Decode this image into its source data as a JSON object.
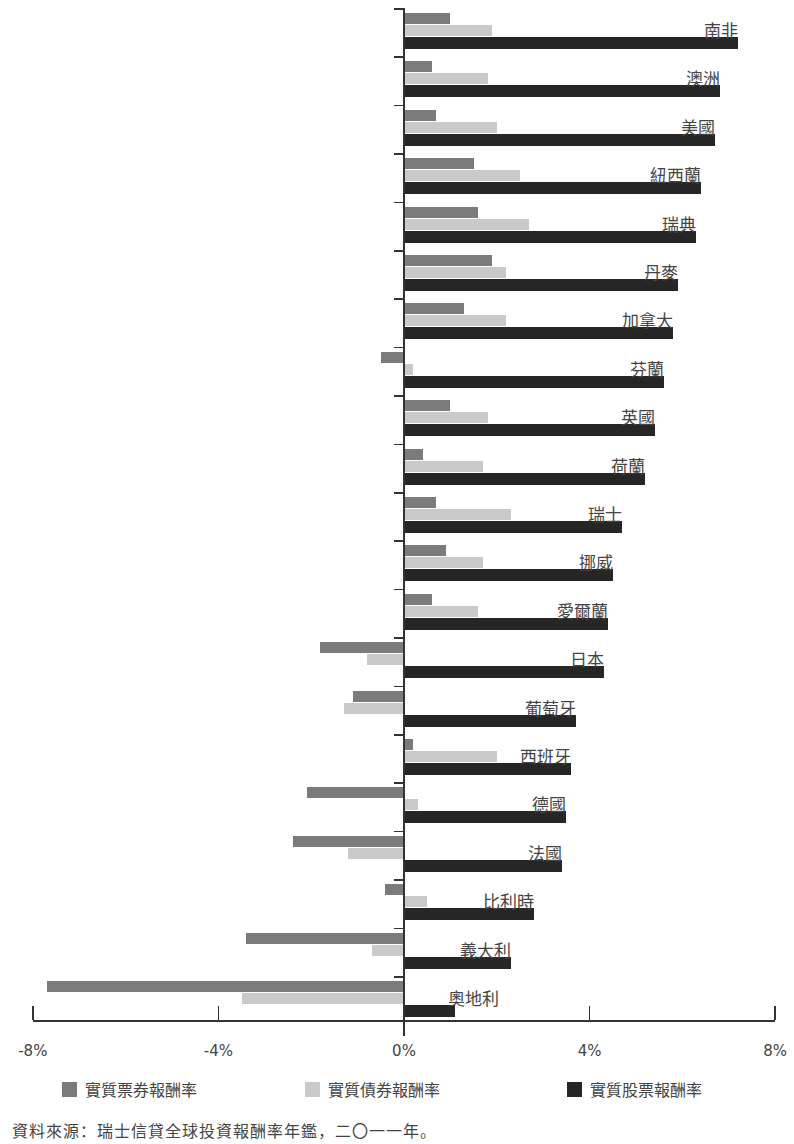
{
  "chart_data": {
    "type": "bar",
    "orientation": "horizontal",
    "title": "",
    "xlabel": "",
    "ylabel": "",
    "xlim": [
      -8,
      8
    ],
    "x_ticks": [
      "-8%",
      "-4%",
      "0%",
      "4%",
      "8%"
    ],
    "x_tick_values": [
      -8,
      -4,
      0,
      4,
      8
    ],
    "grid": false,
    "legend_position": "bottom",
    "categories": [
      "南非",
      "澳洲",
      "美國",
      "紐西蘭",
      "瑞典",
      "丹麥",
      "加拿大",
      "芬蘭",
      "英國",
      "荷蘭",
      "瑞士",
      "挪威",
      "愛爾蘭",
      "日本",
      "葡萄牙",
      "西班牙",
      "德國",
      "法國",
      "比利時",
      "義大利",
      "奧地利"
    ],
    "series": [
      {
        "name": "實質票券報酬率",
        "key": "bill",
        "color": "#7b7b7b",
        "values": [
          1.0,
          0.6,
          0.7,
          1.5,
          1.6,
          1.9,
          1.3,
          -0.5,
          1.0,
          0.4,
          0.7,
          0.9,
          0.6,
          -1.8,
          -1.1,
          0.2,
          -2.1,
          -2.4,
          -0.4,
          -3.4,
          -7.7
        ]
      },
      {
        "name": "實質債券報酬率",
        "key": "bond",
        "color": "#c9c9c9",
        "values": [
          1.9,
          1.8,
          2.0,
          2.5,
          2.7,
          2.2,
          2.2,
          0.2,
          1.8,
          1.7,
          2.3,
          1.7,
          1.6,
          -0.8,
          -1.3,
          2.0,
          0.3,
          -1.2,
          0.5,
          -0.7,
          -3.5
        ]
      },
      {
        "name": "實質股票報酬率",
        "key": "equity",
        "color": "#262626",
        "values": [
          7.2,
          6.8,
          6.7,
          6.4,
          6.3,
          5.9,
          5.8,
          5.6,
          5.4,
          5.2,
          4.7,
          4.5,
          4.4,
          4.3,
          3.7,
          3.6,
          3.5,
          3.4,
          2.8,
          2.3,
          1.1
        ]
      }
    ],
    "source": "資料來源：瑞士信貸全球投資報酬率年鑑，二〇一一年。"
  },
  "legend": {
    "items": [
      {
        "label": "實質票券報酬率",
        "color": "#7b7b7b"
      },
      {
        "label": "實質債券報酬率",
        "color": "#c9c9c9"
      },
      {
        "label": "實質股票報酬率",
        "color": "#262626"
      }
    ]
  },
  "axis": {
    "ticks": [
      {
        "label": "-8%",
        "value": -8
      },
      {
        "label": "-4%",
        "value": -4
      },
      {
        "label": "0%",
        "value": 0
      },
      {
        "label": "4%",
        "value": 4
      },
      {
        "label": "8%",
        "value": 8
      }
    ]
  },
  "source_note": "資料來源：瑞士信貸全球投資報酬率年鑑，二〇一一年。"
}
